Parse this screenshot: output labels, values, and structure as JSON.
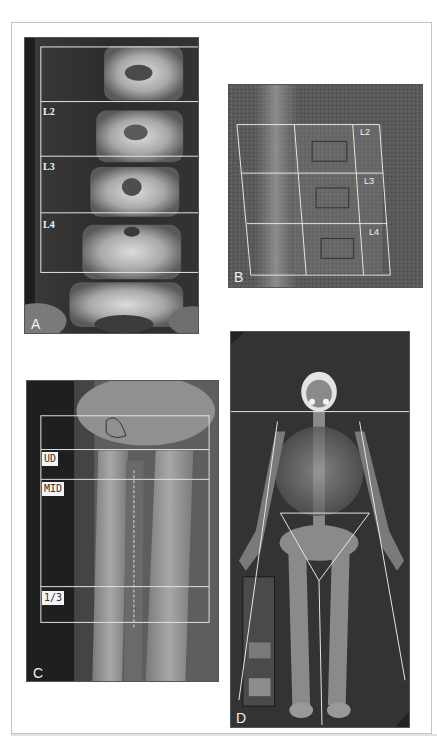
{
  "figure": {
    "panels": [
      {
        "id": "A",
        "letter": "A",
        "description": "Lumbar spine DXA scan, posteroanterior view",
        "region_labels": [
          "L2",
          "L3",
          "L4"
        ]
      },
      {
        "id": "B",
        "letter": "B",
        "description": "Lateral lumbar spine DXA scan",
        "region_labels": [
          "L2",
          "L3",
          "L4"
        ]
      },
      {
        "id": "C",
        "letter": "C",
        "description": "Forearm (radius/ulna) DXA scan",
        "region_labels": [
          "UD",
          "MID",
          "1/3"
        ]
      },
      {
        "id": "D",
        "letter": "D",
        "description": "Whole body DXA scan with regional lines",
        "region_labels": []
      }
    ]
  },
  "colors": {
    "background": "#ffffff",
    "frame_border": "#c4c4c4",
    "scan_dark": "#2a2a2a",
    "roi_line": "#e8e8e8"
  }
}
